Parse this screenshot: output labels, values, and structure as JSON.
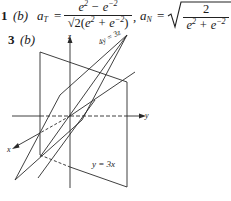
{
  "problem1": {
    "number": "1",
    "part": "(b)",
    "aT_label": "a",
    "aT_sub": "T",
    "equals": "=",
    "aT_numerator": "e² − e⁻²",
    "aT_denominator": "√2(e² + e⁻²)",
    "separator": ",",
    "aN_label": "a",
    "aN_sub": "N",
    "aN_numerator": "2",
    "aN_denominator": "e² + e⁻²"
  },
  "problem3": {
    "number": "3",
    "part": "(b)"
  },
  "figure": {
    "axis_labels": {
      "x": "x",
      "y": "y",
      "z": "z"
    },
    "plane_labels": {
      "vertical_plane": "y = 3x",
      "slanted_plane": "4y = 3z"
    },
    "line_color": "#2a2a2a"
  }
}
